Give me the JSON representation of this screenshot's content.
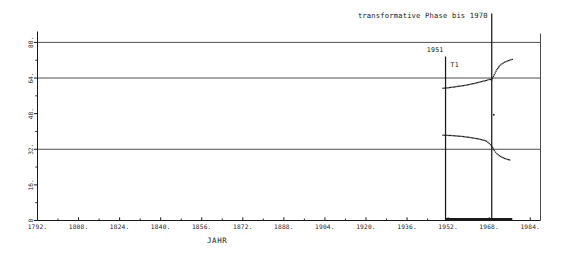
{
  "chart_data": {
    "type": "line",
    "title": "",
    "xlabel": "JAHR",
    "ylabel": "",
    "xlim": [
      1792,
      1988
    ],
    "ylim": [
      0,
      84
    ],
    "grid": true,
    "grid_y_values": [
      32,
      64,
      80
    ],
    "legend": "none",
    "x_ticks": [
      "1792.",
      "1808.",
      "1824.",
      "1840.",
      "1856.",
      "1872.",
      "1888.",
      "1904.",
      "1920.",
      "1936.",
      "1952.",
      "1968.",
      "1984."
    ],
    "x_tick_values": [
      1792,
      1808,
      1824,
      1840,
      1856,
      1872,
      1888,
      1904,
      1920,
      1936,
      1952,
      1968,
      1984
    ],
    "y_ticks": [
      "0",
      "16.",
      "32.",
      "48.",
      "64.",
      "80."
    ],
    "y_tick_values": [
      0,
      16,
      32,
      48,
      64,
      80
    ],
    "y_minor_values": [
      8,
      24,
      40,
      56,
      72
    ],
    "series": [
      {
        "name": "upper-branch",
        "style": "dotted",
        "x": [
          1950,
          1951,
          1952,
          1953,
          1954,
          1955,
          1956,
          1957,
          1958,
          1959,
          1960,
          1961,
          1962,
          1963,
          1964,
          1965,
          1966,
          1967,
          1968,
          1969,
          1970,
          1971,
          1972,
          1973,
          1974,
          1975,
          1976,
          1977
        ],
        "y": [
          59.4,
          59.5,
          59.6,
          59.8,
          59.9,
          60.1,
          60.3,
          60.4,
          60.6,
          60.8,
          61.0,
          61.3,
          61.5,
          61.8,
          62.1,
          62.4,
          62.7,
          62.9,
          63.4,
          63.2,
          65.5,
          67.8,
          69.4,
          70.4,
          71.1,
          71.6,
          72.0,
          72.4
        ]
      },
      {
        "name": "lower-branch",
        "style": "dotted",
        "x": [
          1950,
          1951,
          1952,
          1953,
          1954,
          1955,
          1956,
          1957,
          1958,
          1959,
          1960,
          1961,
          1962,
          1963,
          1964,
          1965,
          1966,
          1967,
          1968,
          1969,
          1970,
          1971,
          1972,
          1973,
          1974,
          1975,
          1976
        ],
        "y": [
          38.3,
          38.3,
          38.2,
          38.2,
          38.1,
          38.0,
          37.9,
          37.8,
          37.7,
          37.5,
          37.4,
          37.2,
          37.0,
          36.8,
          36.6,
          36.3,
          36.0,
          35.6,
          34.6,
          33.4,
          31.4,
          30.0,
          29.1,
          28.4,
          27.9,
          27.5,
          27.2
        ]
      },
      {
        "name": "baseline-band",
        "style": "thick",
        "x": [
          1951,
          1977
        ],
        "y": [
          0,
          0
        ]
      }
    ],
    "markers": [
      {
        "name": "marker-1951",
        "x": 1951,
        "label": "1951",
        "sublabel": "T1"
      },
      {
        "name": "marker-1969",
        "x": 1969,
        "label": ""
      }
    ],
    "annotations": [
      {
        "name": "phase-annotation",
        "text": "transformative Phase bis 1970",
        "x": 1969
      }
    ]
  },
  "axes": {
    "x_title": "JAHR",
    "y_origin_label": "0"
  },
  "annotation": {
    "phase_text": "transformative Phase bis 1970",
    "year_label": "1951",
    "t1_label": "T1"
  },
  "x_tick_labels": {
    "t0": "1792.",
    "t1": "1808.",
    "t2": "1824.",
    "t3": "1840.",
    "t4": "1856.",
    "t5": "1872.",
    "t6": "1888.",
    "t7": "1904.",
    "t8": "1920.",
    "t9": "1936.",
    "t10": "1952.",
    "t11": "1968.",
    "t12": "1984."
  },
  "y_tick_labels": {
    "v0": "0",
    "v16": "16.",
    "v32": "32.",
    "v48": "48.",
    "v64": "64.",
    "v80": "80."
  },
  "colors": {
    "ink": "#1a1a1a",
    "grid": "#3a3a3a",
    "background": "#ffffff"
  }
}
